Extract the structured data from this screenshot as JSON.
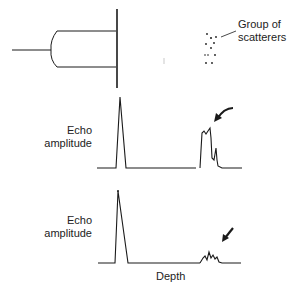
{
  "figure": {
    "transducer_label": "",
    "scatterers_label_line1": "Group of",
    "scatterers_label_line2": "scatterers",
    "trace1": {
      "ylabel_line1": "Echo",
      "ylabel_line2": "amplitude"
    },
    "trace2": {
      "ylabel_line1": "Echo",
      "ylabel_line2": "amplitude",
      "xlabel": "Depth"
    }
  },
  "colors": {
    "ink": "#1a1a1a",
    "background": "#ffffff"
  }
}
